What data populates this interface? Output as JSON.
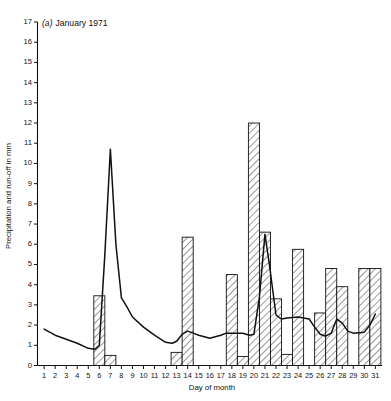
{
  "chart_data": {
    "type": "bar",
    "title_prefix": "(a)",
    "title_main": "January 1971",
    "xlabel": "Day of month",
    "ylabel": "Precipitation and run-off in mm",
    "xlim": [
      0.4,
      31.6
    ],
    "ylim": [
      0,
      17
    ],
    "yticks": [
      0,
      1,
      2,
      3,
      4,
      5,
      6,
      7,
      8,
      9,
      10,
      11,
      12,
      13,
      14,
      15,
      16,
      17
    ],
    "ytick_labels": [
      "0",
      "1",
      "2",
      "3",
      "4",
      "5",
      "6",
      "7",
      "8",
      "9",
      "10",
      "11",
      "12",
      "13",
      "14",
      "15",
      "16",
      "17"
    ],
    "grid": false,
    "legend": null,
    "categories": [
      1,
      2,
      3,
      4,
      5,
      6,
      7,
      8,
      9,
      10,
      11,
      12,
      13,
      14,
      15,
      16,
      17,
      18,
      19,
      20,
      21,
      22,
      23,
      24,
      25,
      26,
      27,
      28,
      29,
      30,
      31
    ],
    "xtick_labels": [
      "1",
      "2",
      "3",
      "4",
      "5",
      "6",
      "7",
      "8",
      "9",
      "10",
      "11",
      "12",
      "13",
      "14",
      "15",
      "16",
      "17",
      "18",
      "19",
      "20",
      "21",
      "22",
      "23",
      "24",
      "25",
      "26",
      "27",
      "28",
      "29",
      "30",
      "31"
    ],
    "series": [
      {
        "name": "Precipitation",
        "kind": "bar",
        "hatch": "diagonal",
        "fill": "#ffffff",
        "edge": "#111111",
        "values": [
          0,
          0,
          0,
          0,
          0,
          3.45,
          0.5,
          0,
          0,
          0,
          0,
          0,
          0.65,
          6.35,
          0,
          0,
          0,
          4.5,
          0.45,
          12.0,
          6.6,
          3.3,
          0.55,
          5.75,
          0,
          2.6,
          4.8,
          3.9,
          0,
          4.8,
          4.8
        ]
      },
      {
        "name": "Run-off",
        "kind": "line",
        "color": "#111111",
        "x": [
          1,
          2,
          3,
          4,
          5,
          5.6,
          6,
          6.5,
          7,
          7.5,
          8,
          8.5,
          9,
          10,
          11,
          12,
          12.6,
          13,
          13.5,
          14,
          14.5,
          15,
          16,
          17,
          17.5,
          18,
          18.5,
          19,
          19.6,
          20,
          20.5,
          21,
          21.4,
          22,
          22.5,
          23,
          24,
          25,
          25.5,
          26,
          26.5,
          27,
          27.5,
          28,
          28.5,
          29,
          30,
          30.5,
          31
        ],
        "y": [
          1.8,
          1.5,
          1.3,
          1.1,
          0.85,
          0.8,
          1.0,
          5.5,
          10.7,
          6.0,
          3.35,
          2.9,
          2.4,
          1.9,
          1.5,
          1.15,
          1.1,
          1.2,
          1.55,
          1.7,
          1.6,
          1.5,
          1.35,
          1.5,
          1.6,
          1.6,
          1.6,
          1.6,
          1.5,
          1.55,
          3.4,
          6.5,
          5.0,
          2.5,
          2.3,
          2.35,
          2.4,
          2.3,
          1.9,
          1.55,
          1.45,
          1.6,
          2.3,
          2.1,
          1.7,
          1.6,
          1.65,
          2.0,
          2.55
        ]
      }
    ]
  }
}
